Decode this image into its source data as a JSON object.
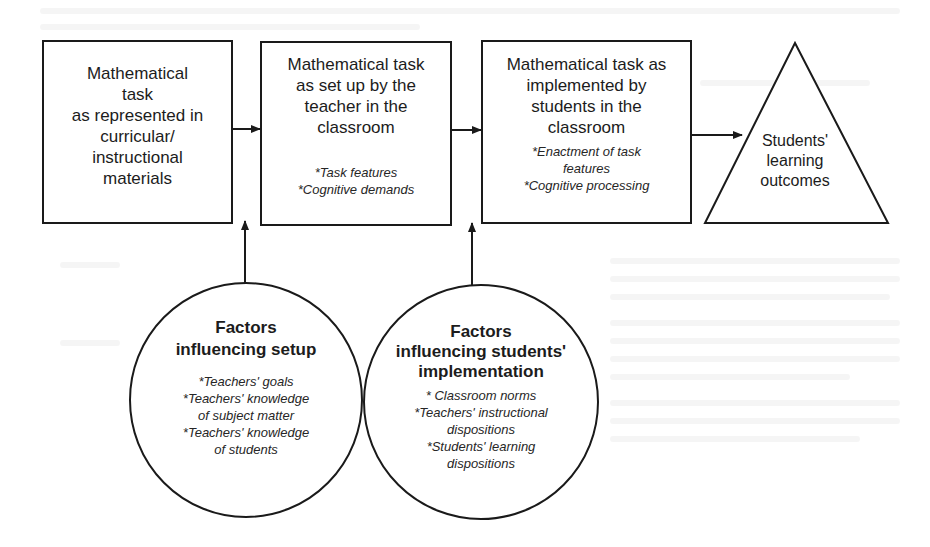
{
  "diagram": {
    "type": "flow-framework",
    "colors": {
      "stroke": "#1a1a1a",
      "text": "#1c1c1c",
      "background": "#ffffff"
    },
    "boxes": [
      {
        "id": "box-curricular",
        "title_lines": [
          "Mathematical",
          "task",
          "as represented in",
          "curricular/",
          "instructional",
          "materials"
        ],
        "items": []
      },
      {
        "id": "box-setup",
        "title_lines": [
          "Mathematical task",
          "as set up by the",
          "teacher in the",
          "classroom"
        ],
        "items": [
          "*Task features",
          "*Cognitive demands"
        ]
      },
      {
        "id": "box-implemented",
        "title_lines": [
          "Mathematical task as",
          "implemented by",
          "students in the",
          "classroom"
        ],
        "items": [
          "*Enactment of task",
          "features",
          "*Cognitive processing"
        ]
      }
    ],
    "outcome": {
      "shape": "triangle",
      "title_lines": [
        "Students'",
        "learning",
        "outcomes"
      ]
    },
    "circles": [
      {
        "id": "circle-setup",
        "title_lines": [
          "Factors",
          "influencing setup"
        ],
        "items": [
          "*Teachers' goals",
          "*Teachers' knowledge",
          "of subject matter",
          "*Teachers' knowledge",
          "of students"
        ]
      },
      {
        "id": "circle-implementation",
        "title_lines": [
          "Factors",
          "influencing students'",
          "implementation"
        ],
        "items": [
          "* Classroom norms",
          "*Teachers' instructional",
          "dispositions",
          "*Students' learning",
          "dispositions"
        ]
      }
    ],
    "arrows": [
      {
        "from": "box-curricular",
        "to": "box-setup"
      },
      {
        "from": "box-setup",
        "to": "box-implemented"
      },
      {
        "from": "box-implemented",
        "to": "outcome"
      },
      {
        "from": "circle-setup",
        "to": "arrow between box-curricular and box-setup"
      },
      {
        "from": "circle-implementation",
        "to": "arrow between box-setup and box-implemented"
      }
    ]
  }
}
